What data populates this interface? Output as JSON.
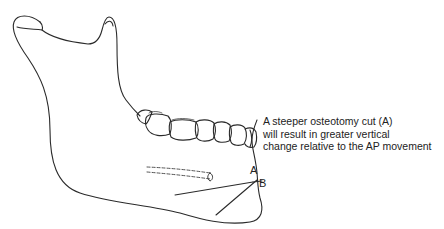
{
  "figure": {
    "caption_lines": [
      "A steeper osteotomy cut (A)",
      "will result in greater vertical",
      "change relative to the AP movement"
    ],
    "labels": {
      "point_a": "A",
      "point_b": "B"
    },
    "colors": {
      "line": "#2a2a2a",
      "text": "#222222",
      "background": "#ffffff"
    }
  }
}
